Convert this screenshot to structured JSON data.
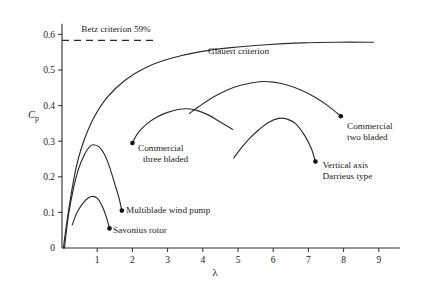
{
  "chart_data": {
    "type": "line",
    "title": "",
    "xlabel": "λ",
    "ylabel": "C_p",
    "ylabel_base": "C",
    "ylabel_sub": "p",
    "xlim": [
      0,
      9.6
    ],
    "ylim": [
      0,
      0.63
    ],
    "grid": false,
    "legend": "inline-annotations",
    "xticks": [
      1,
      2,
      3,
      4,
      5,
      6,
      7,
      8,
      9
    ],
    "xticklabels": [
      "1",
      "2",
      "3",
      "4",
      "5",
      "6",
      "7",
      "8",
      "9"
    ],
    "yticks": [
      0,
      0.1,
      0.2,
      0.3,
      0.4,
      0.5,
      0.6
    ],
    "yticklabels": [
      "0",
      "0.1",
      "0.2",
      "0.3",
      "0.4",
      "0.5",
      "0.6"
    ],
    "reference_lines": [
      {
        "name": "betz-criterion",
        "label": "Betz criterion 59%",
        "value": 0.583,
        "style": "dashed",
        "x_start": 0.0,
        "x_end": 2.7,
        "label_x": 0.55,
        "label_y": 0.615
      }
    ],
    "series": [
      {
        "name": "glauert-criterion",
        "label": "Glauert criterion",
        "label_x": 4.15,
        "label_y": 0.545,
        "marker_end": false,
        "points": [
          [
            0.04,
            0.0
          ],
          [
            0.12,
            0.06
          ],
          [
            0.25,
            0.145
          ],
          [
            0.4,
            0.225
          ],
          [
            0.6,
            0.295
          ],
          [
            0.9,
            0.365
          ],
          [
            1.3,
            0.425
          ],
          [
            1.8,
            0.472
          ],
          [
            2.4,
            0.508
          ],
          [
            3.1,
            0.533
          ],
          [
            3.9,
            0.551
          ],
          [
            4.8,
            0.563
          ],
          [
            5.8,
            0.571
          ],
          [
            6.8,
            0.576
          ],
          [
            7.8,
            0.578
          ],
          [
            8.85,
            0.578
          ]
        ]
      },
      {
        "name": "savonius-rotor",
        "label": "Savonius rotor",
        "label_x": 1.45,
        "label_y": 0.043,
        "marker_end": true,
        "marker_x": 1.35,
        "marker_y": 0.055,
        "points": [
          [
            0.29,
            0.065
          ],
          [
            0.42,
            0.098
          ],
          [
            0.58,
            0.124
          ],
          [
            0.75,
            0.141
          ],
          [
            0.87,
            0.145
          ],
          [
            1.0,
            0.14
          ],
          [
            1.12,
            0.122
          ],
          [
            1.24,
            0.093
          ],
          [
            1.35,
            0.055
          ]
        ]
      },
      {
        "name": "multiblade-wind-pump",
        "label": "Multiblade wind pump",
        "label_x": 1.82,
        "label_y": 0.097,
        "marker_end": true,
        "marker_x": 1.7,
        "marker_y": 0.105,
        "points": [
          [
            0.07,
            0.0
          ],
          [
            0.18,
            0.09
          ],
          [
            0.32,
            0.165
          ],
          [
            0.48,
            0.225
          ],
          [
            0.65,
            0.265
          ],
          [
            0.8,
            0.286
          ],
          [
            0.9,
            0.29
          ],
          [
            1.05,
            0.284
          ],
          [
            1.2,
            0.264
          ],
          [
            1.35,
            0.228
          ],
          [
            1.5,
            0.18
          ],
          [
            1.62,
            0.14
          ],
          [
            1.7,
            0.105
          ]
        ]
      },
      {
        "name": "commercial-three-bladed",
        "label": "Commercial three bladed",
        "label_line1": "Commercial",
        "label_line2": "three bladed",
        "label_x": 2.16,
        "label_y": 0.272,
        "marker_end": true,
        "marker_x": 2.0,
        "marker_y": 0.295,
        "points": [
          [
            2.0,
            0.295
          ],
          [
            2.15,
            0.322
          ],
          [
            2.4,
            0.348
          ],
          [
            2.7,
            0.368
          ],
          [
            3.0,
            0.381
          ],
          [
            3.3,
            0.389
          ],
          [
            3.55,
            0.391
          ],
          [
            3.85,
            0.386
          ],
          [
            4.15,
            0.374
          ],
          [
            4.45,
            0.357
          ],
          [
            4.7,
            0.342
          ],
          [
            4.85,
            0.333
          ]
        ]
      },
      {
        "name": "commercial-two-bladed",
        "label": "Commercial two bladed",
        "label_line1": "Commercial",
        "label_line2": "two bladed",
        "label_x": 8.1,
        "label_y": 0.335,
        "marker_end": true,
        "marker_x": 7.92,
        "marker_y": 0.37,
        "points": [
          [
            3.62,
            0.378
          ],
          [
            3.9,
            0.398
          ],
          [
            4.3,
            0.424
          ],
          [
            4.7,
            0.444
          ],
          [
            5.1,
            0.458
          ],
          [
            5.6,
            0.467
          ],
          [
            6.0,
            0.466
          ],
          [
            6.4,
            0.458
          ],
          [
            6.8,
            0.443
          ],
          [
            7.2,
            0.423
          ],
          [
            7.55,
            0.4
          ],
          [
            7.92,
            0.37
          ]
        ]
      },
      {
        "name": "vertical-axis-darrieus",
        "label": "Vertical axis Darrieus type",
        "label_line1": "Vertical axis",
        "label_line2": "Darrieus type",
        "label_x": 7.4,
        "label_y": 0.225,
        "marker_end": true,
        "marker_x": 7.2,
        "marker_y": 0.243,
        "points": [
          [
            4.88,
            0.253
          ],
          [
            5.1,
            0.282
          ],
          [
            5.35,
            0.31
          ],
          [
            5.6,
            0.333
          ],
          [
            5.85,
            0.352
          ],
          [
            6.15,
            0.364
          ],
          [
            6.4,
            0.362
          ],
          [
            6.65,
            0.348
          ],
          [
            6.9,
            0.315
          ],
          [
            7.08,
            0.28
          ],
          [
            7.2,
            0.243
          ]
        ]
      }
    ]
  }
}
